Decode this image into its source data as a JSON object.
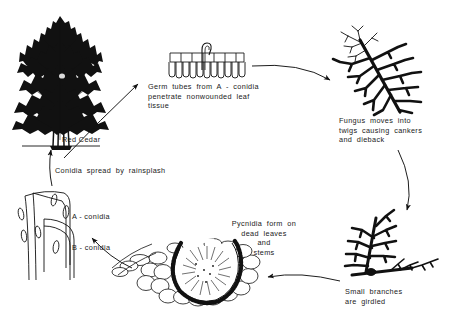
{
  "diagram": {
    "background_color": "#ffffff",
    "ink_color": "#111111",
    "stages": [
      {
        "id": "red-cedar",
        "label": "Red  Cedar",
        "illustration": "conifer-tree"
      },
      {
        "id": "germ-tubes",
        "caption": "Germ  tubes  from  A-conidia\npenetrate  nonwounded  leaf\ntissue",
        "illustration": "leaf-epidermis-cells-with-germ-tube"
      },
      {
        "id": "fungus-twigs",
        "caption": "Fungus  moves  into\ntwigs  causing  cankers\nand  dieback",
        "illustration": "branch-with-dieback"
      },
      {
        "id": "small-branches",
        "caption": "Small   branches\nare   girdled",
        "illustration": "branch-girdled"
      },
      {
        "id": "pycnidia",
        "caption": "Pycnidia  form  on\ndead  leaves\nand\nstems",
        "illustration": "pycnidium-cross-section"
      },
      {
        "id": "conidia",
        "labels": [
          "A-conidia",
          "B-conidia"
        ],
        "illustration": "conidia-spores"
      },
      {
        "id": "rainsplash",
        "caption": "Conidia   spread   by   rainsplash",
        "illustration": "arrow-upward"
      }
    ],
    "labels": {
      "red_cedar": "Red   Cedar",
      "a_conidia": "A - conidia",
      "b_conidia": "B - conidia"
    },
    "captions": {
      "germ_tubes": "Germ  tubes  from  A - conidia\npenetrate  nonwounded  leaf\ntissue",
      "fungus_twigs": "Fungus  moves  into\ntwigs  causing  cankers\nand  dieback",
      "small_branches": "Small   branches\nare   girdled",
      "pycnidia": "Pycnidia  form  on\ndead  leaves\nand\nstems",
      "rainsplash": "Conidia   spread   by   rainsplash"
    },
    "arrows": [
      {
        "id": "tree-to-leaf",
        "from": "red-cedar",
        "to": "germ-tubes",
        "direction": "right-up"
      },
      {
        "id": "leaf-to-branch",
        "from": "germ-tubes",
        "to": "fungus-twigs",
        "direction": "right"
      },
      {
        "id": "branch-to-girdled",
        "from": "fungus-twigs",
        "to": "small-branches",
        "direction": "down"
      },
      {
        "id": "girdled-to-pycnidia",
        "from": "small-branches",
        "to": "pycnidia",
        "direction": "left"
      },
      {
        "id": "pycnidia-to-conidia",
        "from": "pycnidia",
        "to": "conidia",
        "direction": "left-up"
      },
      {
        "id": "conidia-to-tree",
        "from": "conidia",
        "to": "red-cedar",
        "direction": "up"
      }
    ]
  }
}
